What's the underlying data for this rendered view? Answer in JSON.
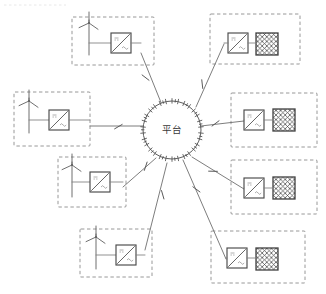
{
  "diagram": {
    "hub": {
      "label": "平台",
      "name": "platform-hub",
      "cx": 172,
      "cy": 130,
      "r": 29,
      "tick_count": 30
    },
    "colors": {
      "background": "#ffffff",
      "dashed_border": "#8c8c8c",
      "wire": "#7d7d7d",
      "device_outline": "#4a4a4a",
      "load_outline": "#3f3f3f",
      "text": "#3a3a3a"
    },
    "legend_note": "",
    "modules": [
      {
        "id": "gen-top-left",
        "name": "generation-module-top-left",
        "side": "left",
        "kind": "generation",
        "box": {
          "x": 72,
          "y": 17,
          "w": 82,
          "h": 48
        },
        "turbine": {
          "x": 89,
          "y": 42
        },
        "inverter": {
          "x": 111,
          "y": 33,
          "w": 20,
          "h": 20,
          "symbol": "dc-ac-inverter"
        },
        "load": null,
        "spoke": {
          "x1": 141,
          "y1": 53,
          "x2": 162,
          "y2": 105
        },
        "switch": {
          "x": 146,
          "y": 77
        }
      },
      {
        "id": "gen-mid-left",
        "name": "generation-module-mid-left",
        "side": "left",
        "kind": "generation",
        "box": {
          "x": 14,
          "y": 92,
          "w": 76,
          "h": 54
        },
        "turbine": {
          "x": 29,
          "y": 120
        },
        "inverter": {
          "x": 49,
          "y": 110,
          "w": 20,
          "h": 20,
          "symbol": "dc-ac-inverter"
        },
        "load": null,
        "spoke": {
          "x1": 90,
          "y1": 126,
          "x2": 143,
          "y2": 126
        },
        "switch": {
          "x": 118,
          "y": 126
        }
      },
      {
        "id": "gen-low-left",
        "name": "generation-module-lower-left",
        "side": "left",
        "kind": "generation",
        "box": {
          "x": 58,
          "y": 157,
          "w": 68,
          "h": 50
        },
        "turbine": {
          "x": 72,
          "y": 184
        },
        "inverter": {
          "x": 90,
          "y": 172,
          "w": 20,
          "h": 20,
          "symbol": "dc-ac-inverter"
        },
        "load": null,
        "spoke": {
          "x1": 123,
          "y1": 187,
          "x2": 156,
          "y2": 158
        },
        "switch": {
          "x": 145,
          "y": 166
        }
      },
      {
        "id": "gen-bottom",
        "name": "generation-module-bottom-left",
        "side": "left",
        "kind": "generation",
        "box": {
          "x": 80,
          "y": 229,
          "w": 72,
          "h": 48
        },
        "turbine": {
          "x": 96,
          "y": 256
        },
        "inverter": {
          "x": 116,
          "y": 245,
          "w": 20,
          "h": 20,
          "symbol": "dc-ac-inverter"
        },
        "load": null,
        "spoke": {
          "x1": 145,
          "y1": 250,
          "x2": 167,
          "y2": 163
        },
        "switch": {
          "x": 162,
          "y": 195
        }
      },
      {
        "id": "load-top-right",
        "name": "load-module-top-right",
        "side": "right",
        "kind": "load",
        "box": {
          "x": 210,
          "y": 14,
          "w": 90,
          "h": 50
        },
        "turbine": null,
        "inverter": {
          "x": 228,
          "y": 33,
          "w": 20,
          "h": 20,
          "symbol": "dc-ac-inverter"
        },
        "load": {
          "x": 256,
          "y": 33,
          "w": 22,
          "h": 22,
          "symbol": "crosshatch-load"
        },
        "spoke": {
          "x1": 224,
          "y1": 44,
          "x2": 196,
          "y2": 107
        },
        "switch": {
          "x": 203,
          "y": 84
        }
      },
      {
        "id": "load-mid-right",
        "name": "load-module-mid-right",
        "side": "right",
        "kind": "load",
        "box": {
          "x": 231,
          "y": 93,
          "w": 86,
          "h": 54
        },
        "turbine": null,
        "inverter": {
          "x": 244,
          "y": 110,
          "w": 20,
          "h": 20,
          "symbol": "dc-ac-inverter"
        },
        "load": {
          "x": 273,
          "y": 109,
          "w": 22,
          "h": 22,
          "symbol": "crosshatch-load"
        },
        "spoke": {
          "x1": 244,
          "y1": 121,
          "x2": 201,
          "y2": 126
        },
        "switch": {
          "x": 216,
          "y": 124
        }
      },
      {
        "id": "load-low-right",
        "name": "load-module-lower-right",
        "side": "right",
        "kind": "load",
        "box": {
          "x": 231,
          "y": 160,
          "w": 86,
          "h": 54
        },
        "turbine": null,
        "inverter": {
          "x": 244,
          "y": 178,
          "w": 20,
          "h": 20,
          "symbol": "dc-ac-inverter"
        },
        "load": {
          "x": 273,
          "y": 177,
          "w": 22,
          "h": 22,
          "symbol": "crosshatch-load"
        },
        "spoke": {
          "x1": 244,
          "y1": 189,
          "x2": 192,
          "y2": 157
        },
        "switch": {
          "x": 213,
          "y": 172
        }
      },
      {
        "id": "load-bottom-right",
        "name": "load-module-bottom-right",
        "side": "right",
        "kind": "load",
        "box": {
          "x": 211,
          "y": 231,
          "w": 94,
          "h": 52
        },
        "turbine": null,
        "inverter": {
          "x": 227,
          "y": 248,
          "w": 20,
          "h": 20,
          "symbol": "dc-ac-inverter"
        },
        "load": {
          "x": 256,
          "y": 248,
          "w": 22,
          "h": 22,
          "symbol": "crosshatch-load"
        },
        "spoke": {
          "x1": 226,
          "y1": 259,
          "x2": 183,
          "y2": 160
        },
        "switch": {
          "x": 196,
          "y": 190
        }
      }
    ]
  }
}
